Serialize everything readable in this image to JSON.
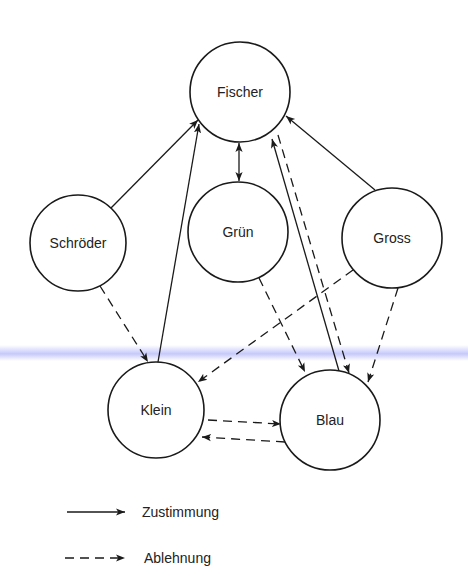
{
  "diagram": {
    "nodes": [
      {
        "id": "fischer",
        "label": "Fischer",
        "cx": 240,
        "cy": 92,
        "r": 50
      },
      {
        "id": "schroeder",
        "label": "Schröder",
        "cx": 78,
        "cy": 243,
        "r": 48
      },
      {
        "id": "gruen",
        "label": "Grün",
        "cx": 238,
        "cy": 232,
        "r": 50
      },
      {
        "id": "gross",
        "label": "Gross",
        "cx": 392,
        "cy": 238,
        "r": 50
      },
      {
        "id": "klein",
        "label": "Klein",
        "cx": 156,
        "cy": 410,
        "r": 48
      },
      {
        "id": "blau",
        "label": "Blau",
        "cx": 330,
        "cy": 420,
        "r": 50
      }
    ],
    "edges": [
      {
        "from": "schroeder",
        "to": "fischer",
        "type": "Zustimmung"
      },
      {
        "from": "klein",
        "to": "fischer",
        "type": "Zustimmung"
      },
      {
        "from": "gross",
        "to": "fischer",
        "type": "Zustimmung"
      },
      {
        "from": "blau",
        "to": "fischer",
        "type": "Zustimmung"
      },
      {
        "from": "fischer",
        "to": "gruen",
        "type": "Zustimmung",
        "bidirectional": true
      },
      {
        "from": "fischer",
        "to": "blau",
        "type": "Ablehnung"
      },
      {
        "from": "schroeder",
        "to": "klein",
        "type": "Ablehnung"
      },
      {
        "from": "gross",
        "to": "klein",
        "type": "Ablehnung"
      },
      {
        "from": "gruen",
        "to": "blau",
        "type": "Ablehnung"
      },
      {
        "from": "gross",
        "to": "blau",
        "type": "Ablehnung"
      },
      {
        "from": "klein",
        "to": "blau",
        "type": "Ablehnung"
      },
      {
        "from": "blau",
        "to": "klein",
        "type": "Ablehnung"
      }
    ]
  },
  "legend": {
    "solid_label": "Zustimmung",
    "dashed_label": "Ablehnung"
  },
  "colors": {
    "ink": "#1a1a1a",
    "background": "#ffffff",
    "scan_streak": "#a8aaf5"
  }
}
